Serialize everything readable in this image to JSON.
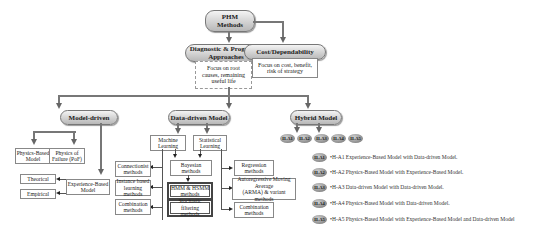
{
  "root": {
    "label_line1": "PHM",
    "label_line2": "Methods"
  },
  "diagnostic": {
    "label_line1": "Diagnostic & Prognostic",
    "label_line2": "Approaches",
    "note_line1": "Focus on root",
    "note_line2": "causes, remaining",
    "note_line3": "useful life"
  },
  "cost": {
    "label": "Cost/Dependability",
    "note_line1": "Focus on cost, benefit,",
    "note_line2": "risk of strategy"
  },
  "model_driven": {
    "label": "Model-driven",
    "physics_based": {
      "line1": "Physics-Based",
      "line2": "Model"
    },
    "pof": {
      "line1": "Physics of",
      "line2": "Failure (PoF)"
    },
    "experience_based": {
      "line1": "Experience-Based",
      "line2": "Model"
    },
    "theorical": "Theorical",
    "empirical": "Empirical"
  },
  "data_driven": {
    "label": "Data-driven Model",
    "machine_learning": {
      "line1": "Machine",
      "line2": "Learning"
    },
    "statistical_learning": {
      "line1": "Statistical",
      "line2": "Learning"
    },
    "connectionist": {
      "line1": "Connectionist",
      "line2": "methods"
    },
    "instance_based": {
      "line1": "Instance based",
      "line2": "learning methods"
    },
    "combination_ml": {
      "line1": "Combination",
      "line2": "methods"
    },
    "bayesian": {
      "line1": "Bayesian",
      "line2": "methods"
    },
    "hmm": {
      "line1": "HMM & HSMM",
      "line2": "methods"
    },
    "stochastic": {
      "line1": "Stochastic filtering",
      "line2": "methods"
    },
    "regression": {
      "line1": "Regression",
      "line2": "methods"
    },
    "arma": {
      "line1": "Autoregressive Moving Average",
      "line2": "(ARMA) & variant",
      "line3": "methods"
    },
    "combination_sl": {
      "line1": "Combination",
      "line2": "methods"
    }
  },
  "hybrid": {
    "label": "Hybrid Model",
    "ovals": [
      "H-A1",
      "H-A2",
      "H-A3",
      "H-A4",
      "H-A5"
    ],
    "legend": [
      {
        "badge": "H-A1",
        "text": "•H-A1  Experience-Based Model with Data-driven Model."
      },
      {
        "badge": "H-A2",
        "text": "•H-A2  Physics-Based Model with Experience-Based Model."
      },
      {
        "badge": "H-A3",
        "text": "•H-A3  Data-driven Model with Data-driven Model."
      },
      {
        "badge": "H-A4",
        "text": "•H-A4  Physics-Based Model with Data-driven Model."
      },
      {
        "badge": "H-A5",
        "text": "•H-A5  Physics-Based Model with Experience-Based Model and Data-driven Model"
      }
    ]
  }
}
